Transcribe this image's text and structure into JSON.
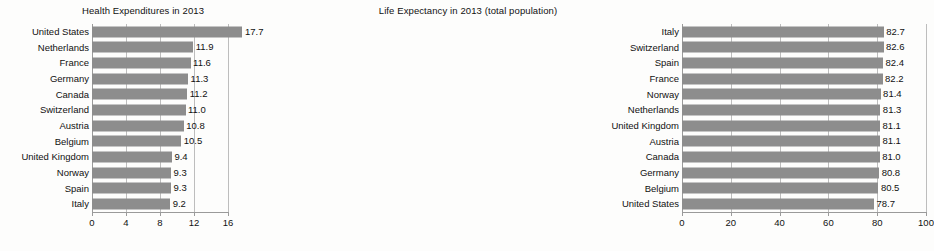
{
  "chart_data": [
    {
      "type": "bar",
      "orientation": "horizontal",
      "title": "Health Expenditures in 2013",
      "xlabel": "",
      "ylabel": "",
      "xlim": [
        0,
        16
      ],
      "ticks": [
        "0",
        "4",
        "8",
        "12",
        "16"
      ],
      "tick_values": [
        0,
        4,
        8,
        12,
        16
      ],
      "grid": true,
      "legend": "none",
      "bar_color": "#8d8d8d",
      "categories": [
        "United States",
        "Netherlands",
        "France",
        "Germany",
        "Canada",
        "Switzerland",
        "Austria",
        "Belgium",
        "United Kingdom",
        "Norway",
        "Spain",
        "Italy"
      ],
      "values": [
        17.7,
        11.9,
        11.6,
        11.3,
        11.2,
        11.0,
        10.8,
        10.5,
        9.4,
        9.3,
        9.3,
        9.2
      ],
      "labels": [
        "17.7",
        "11.9",
        "11.6",
        "11.3",
        "11.2",
        "11.0",
        "10.8",
        "10.5",
        "9.4",
        "9.3",
        "9.3",
        "9.2"
      ]
    },
    {
      "type": "bar",
      "orientation": "horizontal",
      "title": "Life Expectancy in 2013 (total population)",
      "xlabel": "",
      "ylabel": "",
      "xlim": [
        0,
        100
      ],
      "ticks": [
        "0",
        "20",
        "40",
        "60",
        "80",
        "100"
      ],
      "tick_values": [
        0,
        20,
        40,
        60,
        80,
        100
      ],
      "grid": true,
      "legend": "none",
      "bar_color": "#8d8d8d",
      "categories": [
        "Italy",
        "Switzerland",
        "Spain",
        "France",
        "Norway",
        "Netherlands",
        "United Kingdom",
        "Austria",
        "Canada",
        "Germany",
        "Belgium",
        "United States"
      ],
      "values": [
        82.7,
        82.6,
        82.4,
        82.2,
        81.4,
        81.3,
        81.1,
        81.1,
        81.0,
        80.8,
        80.5,
        78.7
      ],
      "labels": [
        "82.7",
        "82.6",
        "82.4",
        "82.2",
        "81.4",
        "81.3",
        "81.1",
        "81.1",
        "81.0",
        "80.8",
        "80.5",
        "78.7"
      ]
    }
  ]
}
